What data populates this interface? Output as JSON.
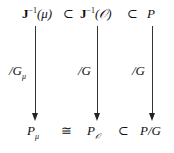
{
  "diagram": {
    "type": "commutative-diagram",
    "top_row": [
      {
        "id": "J_inv_mu",
        "base": "J",
        "sup": "−1",
        "arg": "(μ)"
      },
      {
        "rel": "⊂"
      },
      {
        "id": "J_inv_O",
        "base": "J",
        "sup": "−1",
        "arg": "(𝒪)"
      },
      {
        "rel": "⊂"
      },
      {
        "id": "P",
        "text": "P"
      }
    ],
    "bottom_row": [
      {
        "id": "P_mu",
        "base": "P",
        "sub": "μ"
      },
      {
        "rel": "≅"
      },
      {
        "id": "P_O",
        "base": "P",
        "sub": "𝒪"
      },
      {
        "rel": "⊂"
      },
      {
        "id": "P_mod_G",
        "text": "P/G"
      }
    ],
    "arrows": [
      {
        "from": "J_inv_mu",
        "to": "P_mu",
        "label": "/G",
        "label_sub": "μ"
      },
      {
        "from": "J_inv_O",
        "to": "P_O",
        "label": "/G",
        "label_sub": ""
      },
      {
        "from": "P",
        "to": "P_mod_G",
        "label": "/G",
        "label_sub": ""
      }
    ]
  }
}
